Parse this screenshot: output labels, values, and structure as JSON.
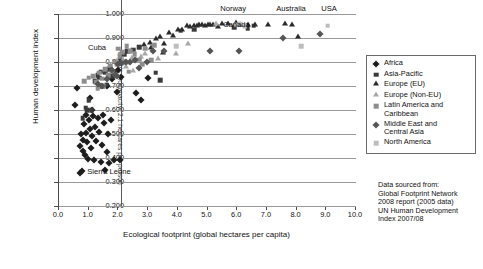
{
  "chart_data": {
    "type": "scatter",
    "title": "",
    "xlabel": "Ecological footprint (global hectares per capita)",
    "ylabel": "Human development index",
    "xlim": [
      0.0,
      10.0
    ],
    "ylim": [
      0.2,
      1.0
    ],
    "xticks": [
      "0.0",
      "1.0",
      "2.0",
      "3.0",
      "4.0",
      "5.0",
      "6.0",
      "7.0",
      "8.0",
      "9.0",
      "10.0"
    ],
    "yticks": [
      "0.200",
      "0.300",
      "0.400",
      "0.500",
      "0.600",
      "0.700",
      "0.800",
      "0.900",
      "1.000"
    ],
    "grid": "horizontal",
    "legend_position": "right",
    "reference_line": {
      "orientation": "vertical",
      "x": 2.1,
      "label": "Earth's biocapacity: 2.1 hectares per person"
    },
    "annotations": [
      {
        "text": "Cuba",
        "x": 1.85,
        "y": 0.855
      },
      {
        "text": "Sierra Leone",
        "x": 0.85,
        "y": 0.337
      },
      {
        "text": "Norway",
        "x": 6.0,
        "y": 0.985
      },
      {
        "text": "Canada",
        "x": 6.2,
        "y": 0.955
      },
      {
        "text": "Australia",
        "x": 7.45,
        "y": 0.985
      },
      {
        "text": "USA",
        "x": 9.1,
        "y": 0.985
      }
    ],
    "series": [
      {
        "name": "Africa",
        "marker": "diamond",
        "color": "#1d1d1d",
        "points": [
          [
            0.55,
            0.62
          ],
          [
            0.6,
            0.69
          ],
          [
            0.7,
            0.337
          ],
          [
            0.72,
            0.452
          ],
          [
            0.75,
            0.5
          ],
          [
            0.78,
            0.345
          ],
          [
            0.8,
            0.43
          ],
          [
            0.82,
            0.476
          ],
          [
            0.85,
            0.54
          ],
          [
            0.88,
            0.412
          ],
          [
            0.9,
            0.58
          ],
          [
            0.92,
            0.505
          ],
          [
            0.95,
            0.466
          ],
          [
            0.98,
            0.395
          ],
          [
            1.0,
            0.56
          ],
          [
            1.05,
            0.648
          ],
          [
            1.05,
            0.52
          ],
          [
            1.08,
            0.44
          ],
          [
            1.1,
            0.6
          ],
          [
            1.12,
            0.49
          ],
          [
            1.15,
            0.575
          ],
          [
            1.18,
            0.392
          ],
          [
            1.2,
            0.53
          ],
          [
            1.25,
            0.47
          ],
          [
            1.3,
            0.565
          ],
          [
            1.35,
            0.51
          ],
          [
            1.4,
            0.385
          ],
          [
            1.45,
            0.455
          ],
          [
            1.48,
            0.58
          ],
          [
            1.5,
            0.545
          ],
          [
            1.55,
            0.348
          ],
          [
            1.6,
            0.7
          ],
          [
            1.62,
            0.425
          ],
          [
            1.65,
            0.498
          ],
          [
            1.7,
            0.38
          ],
          [
            1.75,
            0.56
          ],
          [
            1.8,
            0.73
          ],
          [
            1.85,
            0.39
          ],
          [
            1.95,
            0.675
          ],
          [
            2.0,
            0.765
          ],
          [
            2.05,
            0.39
          ],
          [
            2.1,
            0.736
          ],
          [
            2.15,
            0.8
          ],
          [
            2.6,
            0.672
          ],
          [
            2.75,
            0.64
          ],
          [
            3.0,
            0.733
          ]
        ]
      },
      {
        "name": "Asia-Pacific",
        "marker": "square",
        "color": "#3a3a3a",
        "points": [
          [
            0.8,
            0.566
          ],
          [
            0.9,
            0.61
          ],
          [
            0.95,
            0.598
          ],
          [
            1.0,
            0.64
          ],
          [
            1.1,
            0.598
          ],
          [
            1.2,
            0.72
          ],
          [
            1.3,
            0.745
          ],
          [
            1.35,
            0.735
          ],
          [
            1.4,
            0.76
          ],
          [
            1.45,
            0.7
          ],
          [
            1.55,
            0.755
          ],
          [
            1.6,
            0.705
          ],
          [
            1.7,
            0.77
          ],
          [
            1.75,
            0.74
          ],
          [
            1.85,
            0.76
          ],
          [
            1.95,
            0.8
          ],
          [
            2.05,
            0.795
          ],
          [
            2.1,
            0.81
          ],
          [
            2.2,
            0.83
          ],
          [
            2.3,
            0.845
          ],
          [
            2.5,
            0.852
          ],
          [
            2.7,
            0.862
          ],
          [
            3.25,
            0.755
          ],
          [
            3.4,
            0.724
          ],
          [
            4.1,
            0.93
          ],
          [
            4.55,
            0.935
          ],
          [
            5.9,
            0.944
          ],
          [
            6.35,
            0.942
          ],
          [
            6.55,
            0.952
          ]
        ]
      },
      {
        "name": "Europe (EU)",
        "marker": "triangle",
        "color": "#2b2b2b",
        "points": [
          [
            3.05,
            0.875
          ],
          [
            3.25,
            0.89
          ],
          [
            3.4,
            0.898
          ],
          [
            3.55,
            0.87
          ],
          [
            3.7,
            0.915
          ],
          [
            3.85,
            0.905
          ],
          [
            4.0,
            0.93
          ],
          [
            4.15,
            0.928
          ],
          [
            4.3,
            0.945
          ],
          [
            4.4,
            0.94
          ],
          [
            4.55,
            0.946
          ],
          [
            4.65,
            0.944
          ],
          [
            4.7,
            0.948
          ],
          [
            4.8,
            0.95
          ],
          [
            4.9,
            0.946
          ],
          [
            5.0,
            0.952
          ],
          [
            5.1,
            0.948
          ],
          [
            5.2,
            0.95
          ],
          [
            5.35,
            0.94
          ],
          [
            5.5,
            0.955
          ],
          [
            5.7,
            0.956
          ],
          [
            5.95,
            0.958
          ],
          [
            6.1,
            0.95
          ],
          [
            6.35,
            0.948
          ],
          [
            6.6,
            0.952
          ],
          [
            7.05,
            0.948
          ],
          [
            7.6,
            0.953
          ],
          [
            7.85,
            0.952
          ],
          [
            8.05,
            0.9
          ],
          [
            2.85,
            0.865
          ],
          [
            3.1,
            0.855
          ],
          [
            3.5,
            0.835
          ]
        ]
      },
      {
        "name": "Europe (Non-EU)",
        "marker": "triangle",
        "color": "#a8a8a8",
        "points": [
          [
            1.95,
            0.8
          ],
          [
            2.15,
            0.805
          ],
          [
            2.3,
            0.79
          ],
          [
            2.45,
            0.812
          ],
          [
            2.6,
            0.806
          ],
          [
            2.75,
            0.818
          ],
          [
            2.9,
            0.828
          ],
          [
            3.05,
            0.8
          ],
          [
            3.35,
            0.81
          ],
          [
            3.95,
            0.83
          ],
          [
            4.35,
            0.87
          ],
          [
            5.3,
            0.955
          ],
          [
            2.25,
            0.775
          ],
          [
            2.5,
            0.76
          ]
        ]
      },
      {
        "name": "Latin America and Caribbean",
        "marker": "square",
        "color": "#8d8d8d",
        "points": [
          [
            0.85,
            0.72
          ],
          [
            1.0,
            0.735
          ],
          [
            1.15,
            0.742
          ],
          [
            1.25,
            0.715
          ],
          [
            1.35,
            0.755
          ],
          [
            1.45,
            0.73
          ],
          [
            1.55,
            0.77
          ],
          [
            1.65,
            0.745
          ],
          [
            1.72,
            0.785
          ],
          [
            1.8,
            0.76
          ],
          [
            1.88,
            0.802
          ],
          [
            1.95,
            0.788
          ],
          [
            2.0,
            0.855
          ],
          [
            2.05,
            0.825
          ],
          [
            2.12,
            0.84
          ],
          [
            2.2,
            0.8
          ],
          [
            2.28,
            0.865
          ],
          [
            2.4,
            0.845
          ],
          [
            2.55,
            0.832
          ],
          [
            2.7,
            0.81
          ],
          [
            2.9,
            0.855
          ],
          [
            3.1,
            0.808
          ],
          [
            3.2,
            0.87
          ],
          [
            2.8,
            0.79
          ],
          [
            2.35,
            0.76
          ],
          [
            1.5,
            0.7
          ],
          [
            1.3,
            0.69
          ]
        ]
      },
      {
        "name": "Middle East and Central Asia",
        "marker": "diamond",
        "color": "#555555",
        "points": [
          [
            1.3,
            0.71
          ],
          [
            1.45,
            0.702
          ],
          [
            1.6,
            0.73
          ],
          [
            1.8,
            0.765
          ],
          [
            1.9,
            0.745
          ],
          [
            2.0,
            0.79
          ],
          [
            2.1,
            0.795
          ],
          [
            2.25,
            0.8
          ],
          [
            2.4,
            0.802
          ],
          [
            2.55,
            0.808
          ],
          [
            2.95,
            0.8
          ],
          [
            3.15,
            0.845
          ],
          [
            3.55,
            0.845
          ],
          [
            5.1,
            0.845
          ],
          [
            6.05,
            0.845
          ],
          [
            7.55,
            0.9
          ],
          [
            8.8,
            0.915
          ],
          [
            2.7,
            0.775
          ],
          [
            1.95,
            0.74
          ]
        ]
      },
      {
        "name": "North America",
        "marker": "square",
        "color": "#bdbdbd",
        "points": [
          [
            3.95,
            0.866
          ],
          [
            5.95,
            0.955
          ],
          [
            6.1,
            0.96
          ],
          [
            6.25,
            0.95
          ],
          [
            8.15,
            0.865
          ],
          [
            9.05,
            0.952
          ]
        ]
      }
    ]
  },
  "legend": {
    "items": [
      {
        "label": "Africa",
        "marker": "diamond",
        "color": "#1d1d1d"
      },
      {
        "label": "Asia-Pacific",
        "marker": "square",
        "color": "#3a3a3a"
      },
      {
        "label": "Europe (EU)",
        "marker": "triangle",
        "color": "#2b2b2b"
      },
      {
        "label": "Europe (Non-EU)",
        "marker": "triangle",
        "color": "#a8a8a8"
      },
      {
        "label": "Latin America and\nCaribbean",
        "marker": "square",
        "color": "#8d8d8d"
      },
      {
        "label": "Middle East and\nCentral Asia",
        "marker": "diamond",
        "color": "#555555"
      },
      {
        "label": "North America",
        "marker": "square",
        "color": "#bdbdbd"
      }
    ]
  },
  "source_note": {
    "lines": [
      "Data sourced from:",
      "Global Footprint Network",
      "2008 report (2005 data)",
      "UN Human Development",
      "Index 2007/08"
    ]
  }
}
